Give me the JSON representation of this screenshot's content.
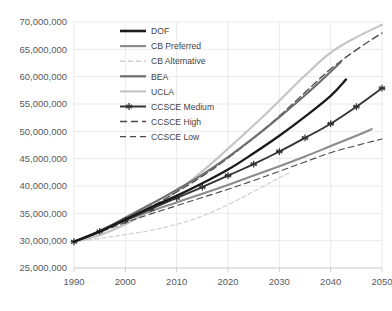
{
  "chart_data": {
    "type": "line",
    "title": "",
    "subtitle": "",
    "xlabel": "",
    "ylabel": "",
    "xlim": [
      1990,
      2050
    ],
    "ylim": [
      25000000,
      70000000
    ],
    "grid": true,
    "legend_position": "inside-top-left",
    "x_ticks": [
      "1990",
      "2000",
      "2010",
      "2020",
      "2030",
      "2040",
      "2050"
    ],
    "y_ticks": [
      "25,000,000",
      "30,000,000",
      "35,000,000",
      "40,000,000",
      "45,000,000",
      "50,000,000",
      "55,000,000",
      "60,000,000",
      "65,000,000",
      "70,000,000"
    ],
    "y_tick_values": [
      25000000,
      30000000,
      35000000,
      40000000,
      45000000,
      50000000,
      55000000,
      60000000,
      65000000,
      70000000
    ],
    "series": [
      {
        "name": "DOF",
        "color": "#1a1a1a",
        "width": 2.3,
        "dash": "none",
        "marker": "none",
        "x": [
          1990,
          1995,
          2000,
          2005,
          2010,
          2015,
          2020,
          2025,
          2030,
          2035,
          2040,
          2043
        ],
        "values": [
          29800000,
          31700000,
          33900000,
          36100000,
          38200000,
          40500000,
          43000000,
          46000000,
          49200000,
          52700000,
          56500000,
          59500000
        ]
      },
      {
        "name": "CB Preferred",
        "color": "#8c8c8c",
        "width": 2.1,
        "dash": "none",
        "marker": "none",
        "x": [
          1990,
          1995,
          2000,
          2005,
          2010,
          2015,
          2020,
          2025,
          2030,
          2035,
          2040,
          2045,
          2048
        ],
        "values": [
          29800000,
          31600000,
          33700000,
          35400000,
          37000000,
          38600000,
          40200000,
          41900000,
          43600000,
          45400000,
          47300000,
          49200000,
          50400000
        ]
      },
      {
        "name": "CB Alternative",
        "color": "#d2d2d2",
        "width": 1.3,
        "dash": "4,3",
        "marker": "none",
        "x": [
          1990,
          1995,
          2000,
          2005,
          2010,
          2015,
          2020,
          2025,
          2030,
          2032
        ],
        "values": [
          29800000,
          30400000,
          31100000,
          31900000,
          33000000,
          34500000,
          36600000,
          39000000,
          41500000,
          42400000
        ]
      },
      {
        "name": "BEA",
        "color": "#6e6e6e",
        "width": 2.1,
        "dash": "none",
        "marker": "none",
        "x": [
          1990,
          1995,
          2000,
          2005,
          2010,
          2015,
          2020,
          2025,
          2030,
          2035,
          2040,
          2042
        ],
        "values": [
          29800000,
          31800000,
          34200000,
          36700000,
          39300000,
          42100000,
          45300000,
          48800000,
          52600000,
          56600000,
          60900000,
          62700000
        ]
      },
      {
        "name": "UCLA",
        "color": "#c4c4c4",
        "width": 2.1,
        "dash": "none",
        "marker": "none",
        "x": [
          1990,
          1995,
          2000,
          2005,
          2010,
          2015,
          2020,
          2025,
          2030,
          2035,
          2040,
          2045,
          2050
        ],
        "values": [
          29800000,
          31000000,
          33000000,
          35700000,
          39000000,
          42700000,
          46800000,
          51100000,
          55600000,
          60200000,
          64400000,
          67200000,
          69500000
        ]
      },
      {
        "name": "CCSCE Medium",
        "color": "#333333",
        "width": 1.8,
        "dash": "none",
        "marker": "star",
        "x": [
          1990,
          1995,
          2000,
          2005,
          2010,
          2015,
          2020,
          2025,
          2030,
          2035,
          2040,
          2045,
          2050
        ],
        "values": [
          29800000,
          31700000,
          33700000,
          35800000,
          37800000,
          39800000,
          41900000,
          44000000,
          46300000,
          48800000,
          51400000,
          54500000,
          57900000
        ]
      },
      {
        "name": "CCSCE High",
        "color": "#4a4a4a",
        "width": 1.3,
        "dash": "7,4",
        "marker": "none",
        "x": [
          1990,
          1995,
          2000,
          2005,
          2010,
          2015,
          2020,
          2025,
          2030,
          2035,
          2040,
          2045,
          2050
        ],
        "values": [
          29800000,
          31700000,
          33800000,
          36200000,
          38900000,
          41800000,
          45100000,
          48800000,
          52800000,
          57100000,
          61400000,
          64900000,
          68000000
        ]
      },
      {
        "name": "CCSCE Low",
        "color": "#4a4a4a",
        "width": 1.1,
        "dash": "6,4",
        "marker": "none",
        "x": [
          1990,
          1995,
          2000,
          2005,
          2010,
          2015,
          2020,
          2025,
          2030,
          2035,
          2040,
          2045,
          2050
        ],
        "values": [
          29800000,
          31500000,
          33300000,
          34900000,
          36400000,
          37900000,
          39400000,
          41000000,
          42700000,
          44400000,
          46100000,
          47400000,
          48600000
        ]
      }
    ],
    "legend": [
      {
        "label": "DOF",
        "color": "#1a1a1a",
        "width": 2.6,
        "dash": "none",
        "marker": "none"
      },
      {
        "label": "CB Preferred",
        "color": "#8c8c8c",
        "width": 2.2,
        "dash": "none",
        "marker": "none"
      },
      {
        "label": "CB Alternative",
        "color": "#d2d2d2",
        "width": 1.6,
        "dash": "5,3",
        "marker": "none"
      },
      {
        "label": "BEA",
        "color": "#6e6e6e",
        "width": 2.2,
        "dash": "none",
        "marker": "none"
      },
      {
        "label": "UCLA",
        "color": "#c4c4c4",
        "width": 2.2,
        "dash": "none",
        "marker": "none"
      },
      {
        "label": "CCSCE Medium",
        "color": "#333333",
        "width": 2.0,
        "dash": "none",
        "marker": "star"
      },
      {
        "label": "CCSCE High",
        "color": "#4a4a4a",
        "width": 1.5,
        "dash": "7,4",
        "marker": "none"
      },
      {
        "label": "CCSCE Low",
        "color": "#4a4a4a",
        "width": 1.3,
        "dash": "6,4",
        "marker": "none"
      }
    ]
  }
}
